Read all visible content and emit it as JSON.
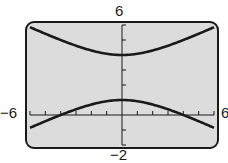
{
  "chart_data": {
    "type": "line",
    "title": "",
    "xlabel": "",
    "ylabel": "",
    "xlim": [
      -6,
      6
    ],
    "ylim": [
      -2,
      6
    ],
    "xscale": 1,
    "yscale": 1,
    "grid": false,
    "window_labels": {
      "ymax": "6",
      "ymin": "−2",
      "xmin": "−6",
      "xmax": "6"
    },
    "series": [
      {
        "name": "upper branch",
        "equation": "(y-2.5)^2/2.25 - x^2/9 = 1 (upper)",
        "x": [
          -6,
          -4,
          -2,
          0,
          2,
          4,
          6
        ],
        "y": [
          5.85,
          5.0,
          4.3,
          4.0,
          4.3,
          5.0,
          5.85
        ]
      },
      {
        "name": "lower branch",
        "equation": "(y-2.5)^2/2.25 - x^2/9 = 1 (lower)",
        "x": [
          -6,
          -4,
          -2,
          0,
          2,
          4,
          6
        ],
        "y": [
          -0.85,
          0.0,
          0.7,
          1.0,
          0.7,
          0.0,
          -0.85
        ]
      }
    ],
    "colors": {
      "screen": "#dcdcdc",
      "curve": "#1a1a1a",
      "frame": "#1a1a1a"
    }
  }
}
